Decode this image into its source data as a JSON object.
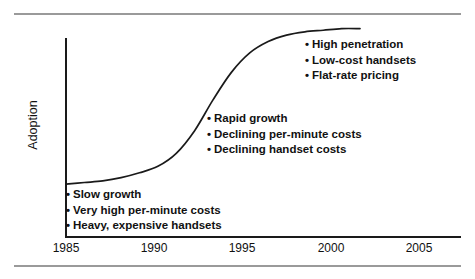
{
  "chart_data": {
    "type": "line",
    "title": "",
    "xlabel": "",
    "ylabel": "Adoption",
    "xlim": [
      1985,
      2005
    ],
    "ylim": [
      0,
      100
    ],
    "grid": false,
    "legend": null,
    "xticks": [
      "1985",
      "1990",
      "1995",
      "2000",
      "2005"
    ],
    "yticks": [],
    "series": [
      {
        "name": "Adoption",
        "x": [
          1985,
          1986,
          1987,
          1988,
          1989,
          1990,
          1991,
          1992,
          1993,
          1994,
          1995,
          1996,
          1997,
          1998,
          1999,
          2000,
          2001
        ],
        "y": [
          3,
          4,
          5,
          7,
          10,
          14,
          22,
          36,
          55,
          72,
          84,
          91,
          95,
          97,
          98,
          99,
          99
        ]
      }
    ],
    "annotations": [
      {
        "name": "slow-growth-phase",
        "x": 1985.2,
        "y": 6,
        "items": [
          "Slow growth",
          "Very high per-minute costs",
          "Heavy, expensive handsets"
        ]
      },
      {
        "name": "rapid-growth-phase",
        "x": 1993.1,
        "y": 58,
        "items": [
          "Rapid growth",
          "Declining per-minute costs",
          "Declining handset costs"
        ]
      },
      {
        "name": "saturation-phase",
        "x": 1998.6,
        "y": 94,
        "items": [
          "High penetration",
          "Low-cost handsets",
          "Flat-rate pricing"
        ]
      }
    ]
  },
  "axis": {
    "y_title": "Adoption",
    "x_ticks": [
      {
        "label": "1985",
        "left": 36
      },
      {
        "label": "1990",
        "left": 124
      },
      {
        "label": "1995",
        "left": 212
      },
      {
        "label": "2000",
        "left": 301
      },
      {
        "label": "2005",
        "left": 389
      }
    ]
  },
  "style": {
    "curve_color": "#1a1a1a",
    "axis_color": "#1a1a1a",
    "rule_color": "#9a9a9a",
    "text_color": "#111111",
    "background": "#ffffff",
    "bullet_glyph": "•"
  }
}
